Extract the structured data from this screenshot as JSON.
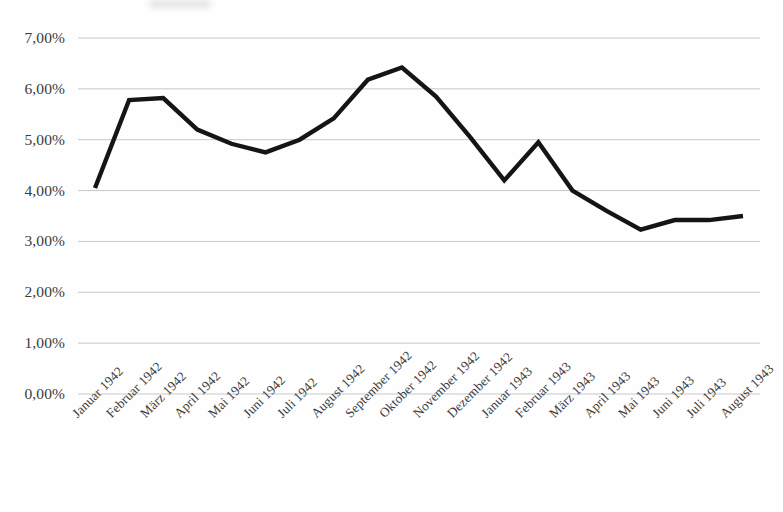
{
  "chart_data": {
    "type": "line",
    "title": "",
    "subtitle": "",
    "xlabel": "",
    "ylabel": "",
    "grid": true,
    "legend": false,
    "legend_position": "none",
    "line_color": "#151515",
    "gridline_color": "#c8c8c8",
    "ylim": [
      0,
      7
    ],
    "ytick_values": [
      0,
      1,
      2,
      3,
      4,
      5,
      6,
      7
    ],
    "ytick_labels": [
      "0,00%",
      "1,00%",
      "2,00%",
      "3,00%",
      "4,00%",
      "5,00%",
      "6,00%",
      "7,00%"
    ],
    "categories": [
      "Januar 1942",
      "Februar 1942",
      "März 1942",
      "April 1942",
      "Mai 1942",
      "Juni 1942",
      "Juli 1942",
      "August 1942",
      "September 1942",
      "Oktober 1942",
      "November 1942",
      "Dezember 1942",
      "Januar 1943",
      "Februar 1943",
      "März 1943",
      "April 1943",
      "Mai 1943",
      "Juni 1943",
      "Juli 1943",
      "August 1943"
    ],
    "values": [
      4.05,
      5.78,
      5.82,
      5.2,
      4.92,
      4.75,
      5.0,
      5.42,
      6.18,
      6.42,
      5.85,
      5.05,
      4.2,
      4.95,
      4.0,
      3.6,
      3.23,
      3.42,
      3.42,
      3.5
    ],
    "value_labels": [
      "4,05%",
      "5,78%",
      "5,82%",
      "5,20%",
      "4,92%",
      "4,75%",
      "5,00%",
      "5,42%",
      "6,18%",
      "6,42%",
      "5,85%",
      "5,05%",
      "4,20%",
      "4,95%",
      "4,00%",
      "3,60%",
      "3,23%",
      "3,42%",
      "3,42%",
      "3,50%"
    ],
    "annotations": []
  }
}
